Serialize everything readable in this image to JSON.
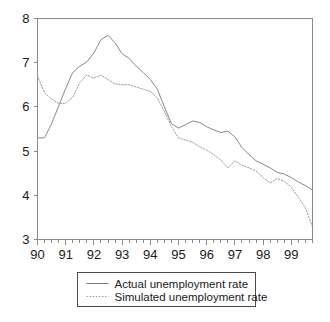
{
  "chart_data": {
    "type": "line",
    "title": "",
    "xlabel": "",
    "ylabel": "",
    "xlim": [
      1990.0,
      1999.75
    ],
    "ylim": [
      3,
      8
    ],
    "grid": false,
    "legend_position": "below-center",
    "y_ticks": [
      "8",
      "7",
      "6",
      "5",
      "4",
      "3"
    ],
    "y_tick_values": [
      8,
      7,
      6,
      5,
      4,
      3
    ],
    "x_ticks": [
      "90",
      "91",
      "92",
      "93",
      "94",
      "95",
      "96",
      "97",
      "98",
      "99"
    ],
    "x_tick_values": [
      1990,
      1991,
      1992,
      1993,
      1994,
      1995,
      1996,
      1997,
      1998,
      1999
    ],
    "minor_ticks_per_year": 4,
    "x": [
      1990.0,
      1990.25,
      1990.5,
      1990.75,
      1991.0,
      1991.25,
      1991.5,
      1991.75,
      1992.0,
      1992.25,
      1992.5,
      1992.75,
      1993.0,
      1993.25,
      1993.5,
      1993.75,
      1994.0,
      1994.25,
      1994.5,
      1994.75,
      1995.0,
      1995.25,
      1995.5,
      1995.75,
      1996.0,
      1996.25,
      1996.5,
      1996.75,
      1997.0,
      1997.25,
      1997.5,
      1997.75,
      1998.0,
      1998.25,
      1998.5,
      1998.75,
      1999.0,
      1999.25,
      1999.5,
      1999.75
    ],
    "series": [
      {
        "name": "Actual unemployment rate",
        "style": "solid",
        "color": "#888888",
        "values": [
          5.3,
          5.3,
          5.62,
          6.02,
          6.42,
          6.78,
          6.92,
          7.02,
          7.22,
          7.52,
          7.62,
          7.45,
          7.2,
          7.1,
          6.92,
          6.78,
          6.62,
          6.4,
          6.0,
          5.62,
          5.52,
          5.6,
          5.68,
          5.65,
          5.55,
          5.48,
          5.42,
          5.45,
          5.32,
          5.08,
          4.92,
          4.78,
          4.7,
          4.62,
          4.52,
          4.48,
          4.4,
          4.3,
          4.22,
          4.12
        ]
      },
      {
        "name": "Simulated unemployment rate",
        "style": "dotted",
        "color": "#999999",
        "values": [
          6.7,
          6.32,
          6.18,
          6.08,
          6.08,
          6.22,
          6.55,
          6.72,
          6.65,
          6.72,
          6.62,
          6.52,
          6.5,
          6.5,
          6.45,
          6.4,
          6.35,
          6.2,
          5.9,
          5.55,
          5.3,
          5.25,
          5.2,
          5.1,
          5.02,
          4.92,
          4.8,
          4.62,
          4.78,
          4.68,
          4.62,
          4.55,
          4.4,
          4.28,
          4.38,
          4.32,
          4.18,
          3.95,
          3.72,
          3.28
        ]
      }
    ],
    "legend": [
      {
        "label": "Actual unemployment rate",
        "style": "solid"
      },
      {
        "label": "Simulated unemployment rate",
        "style": "dotted"
      }
    ]
  },
  "colors": {
    "axis": "#8a8a8a",
    "text": "#1a1a1a",
    "actual": "#888888",
    "simulated": "#999999",
    "legend_border": "#4a4a4a",
    "background": "#ffffff"
  }
}
